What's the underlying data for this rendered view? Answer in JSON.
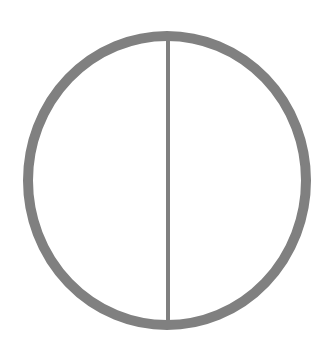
{
  "diagram": {
    "shape": "circle-with-vertical-diameter",
    "stroke_color": "#808080",
    "background_color": "#ffffff",
    "ellipse": {
      "cx": 167,
      "cy": 180.5,
      "rx": 139,
      "ry": 144.5,
      "stroke_width": 10
    },
    "diameter_line": {
      "x1": 168,
      "y1": 36,
      "x2": 168,
      "y2": 325,
      "stroke_width": 4
    }
  }
}
